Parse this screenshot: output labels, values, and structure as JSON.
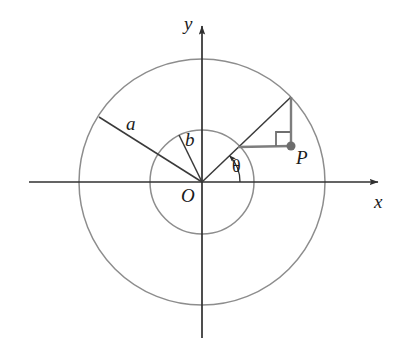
{
  "figure": {
    "kind": "geometry-diagram",
    "background_color": "#ffffff"
  },
  "colors": {
    "circle_stroke": "#8d8d8d",
    "axis_stroke": "#303030",
    "radius_line_stroke": "#3a3a3a",
    "construction_stroke": "#7d7d7d",
    "right_angle_stroke": "#6f6f6f",
    "point_fill": "#6d6d6d",
    "label_color": "#1a1a1a"
  },
  "axes": {
    "x_label": "x",
    "y_label": "y",
    "origin_label": "O",
    "x_axis": {
      "x1": 29,
      "y1": 182,
      "x2": 381,
      "y2": 182
    },
    "y_axis": {
      "x1": 202,
      "y1": 338,
      "x2": 202,
      "y2": 22
    },
    "x_label_pos": {
      "x": 374,
      "y": 192
    },
    "y_label_pos": {
      "x": 184,
      "y": 14
    },
    "origin_label_pos": {
      "x": 181,
      "y": 186
    }
  },
  "circles": {
    "outer": {
      "cx": 202,
      "cy": 182,
      "r": 123,
      "radius_label": "a"
    },
    "inner": {
      "cx": 202,
      "cy": 182,
      "r": 52,
      "radius_label": "b"
    }
  },
  "radius_lines": {
    "a_line": {
      "x1": 202,
      "y1": 182,
      "x2": 99,
      "y2": 117
    },
    "b_line": {
      "x1": 202,
      "y1": 182,
      "x2": 179,
      "y2": 135
    },
    "a_label_pos": {
      "x": 126,
      "y": 114
    },
    "b_label_pos": {
      "x": 185,
      "y": 130
    }
  },
  "ray": {
    "angle_deg": 43.7,
    "angle_label": "θ",
    "angle_label_pos": {
      "x": 232,
      "y": 157
    },
    "from": {
      "x": 202,
      "y": 182
    },
    "to_outer": {
      "x": 291,
      "y": 97
    },
    "at_inner": {
      "x": 238,
      "y": 147
    },
    "arc_radius": 38
  },
  "point_p": {
    "label": "P",
    "x": 291,
    "y": 146,
    "label_pos": {
      "x": 296,
      "y": 148
    },
    "dot_radius": 4.5
  },
  "construction": {
    "vertical_line": {
      "x1": 291,
      "y1": 97,
      "x2": 291,
      "y2": 146
    },
    "horizontal_line": {
      "x1": 238,
      "y1": 147,
      "x2": 291,
      "y2": 146
    },
    "right_angle_marker": {
      "x": 276,
      "y": 132,
      "size": 14
    }
  }
}
